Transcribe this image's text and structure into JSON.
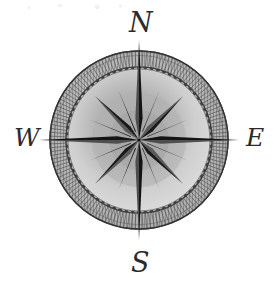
{
  "figure": {
    "kind": "compass-rose-illustration",
    "background_color": "#ffffff"
  },
  "compass": {
    "center": {
      "x": 139,
      "y": 140
    },
    "outer_ring": {
      "outer_radius": 89,
      "inner_radius": 73,
      "fill_color": "#b3b3b3",
      "stroke_color": "#3d3d3d",
      "hatch_color": "#555555",
      "teeth_count": 72
    },
    "inner_disc": {
      "radius": 71,
      "fill_color": "#d4d4d4",
      "shadow_color": "#a8a8a8",
      "stroke_color": "#6e6e6e"
    },
    "star": {
      "points": 8,
      "major_point_radius": 100,
      "minor_point_radius": 62,
      "secondary_ray_radius": 54,
      "light_facet_color": "#4e4e4e",
      "dark_facet_color": "#141414",
      "minor_light_facet_color": "#5a5a5a",
      "minor_dark_facet_color": "#1a1a1a"
    },
    "cardinals": [
      {
        "id": "north",
        "label": "N",
        "bearing_degrees": 0,
        "glyph_name": "script-capital-n"
      },
      {
        "id": "east",
        "label": "E",
        "bearing_degrees": 90,
        "glyph_name": "script-capital-e"
      },
      {
        "id": "south",
        "label": "S",
        "bearing_degrees": 180,
        "glyph_name": "script-capital-s"
      },
      {
        "id": "west",
        "label": "W",
        "bearing_degrees": 270,
        "glyph_name": "script-capital-w"
      }
    ]
  }
}
